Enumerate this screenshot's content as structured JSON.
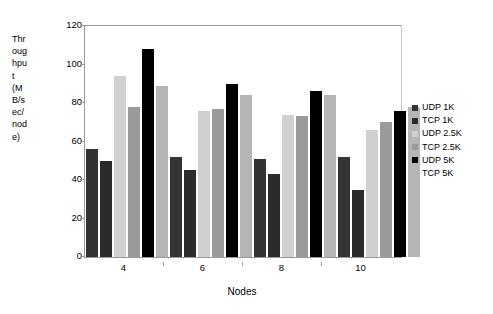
{
  "chart_data": {
    "type": "bar",
    "title": "",
    "xlabel": "Nodes",
    "ylabel": "Throughput (MB/sec/node)",
    "ylabel_lines": [
      "Thr",
      "oug",
      "hpu",
      "t",
      "(M",
      "B/s",
      "ec/",
      "nod",
      "e)"
    ],
    "categories": [
      "4",
      "6",
      "8",
      "10"
    ],
    "yticks": [
      0,
      20,
      40,
      60,
      80,
      100,
      120
    ],
    "ylim": [
      0,
      120
    ],
    "grid": false,
    "legend_position": "right",
    "series": [
      {
        "name": "UDP 1K",
        "color": "#333333",
        "values": [
          56,
          52,
          51,
          52
        ]
      },
      {
        "name": "TCP 1K",
        "color": "#2b2b2b",
        "values": [
          50,
          45,
          43,
          35
        ]
      },
      {
        "name": "UDP 2.5K",
        "color": "#d0d0d0",
        "values": [
          94,
          76,
          74,
          66
        ]
      },
      {
        "name": "TCP 2.5K",
        "color": "#9a9a9a",
        "values": [
          78,
          77,
          73,
          70
        ]
      },
      {
        "name": "UDP 5K",
        "color": "#000000",
        "values": [
          108,
          90,
          86,
          76
        ]
      },
      {
        "name": "TCP 5K",
        "color": "#b5b5b5",
        "values": [
          89,
          84,
          84,
          78
        ]
      }
    ]
  },
  "title_sliver": "",
  "colors": {
    "axis": "#9a9a9a",
    "text": "#000000",
    "background": "#ffffff"
  }
}
